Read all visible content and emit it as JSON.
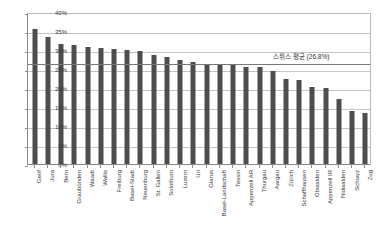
{
  "chart_data": {
    "type": "bar",
    "title": "",
    "xlabel": "",
    "ylabel": "",
    "ylim": [
      0,
      40
    ],
    "ytick_labels": [
      "0%",
      "5%",
      "10%",
      "15%",
      "20%",
      "25%",
      "30%",
      "35%",
      "40%"
    ],
    "ytick_values": [
      0,
      5,
      10,
      15,
      20,
      25,
      30,
      35,
      40
    ],
    "grid": true,
    "legend": "none",
    "bar_color": "#4d4d4d",
    "categories": [
      "Genf",
      "Jura",
      "Bern",
      "Graubünden",
      "Waadt",
      "Wallis",
      "Freiburg",
      "Basel-Stadt",
      "Neuenburg",
      "St. Gallen",
      "Solothurn",
      "Luzern",
      "Uri",
      "Glarus",
      "Basel-Landschaft",
      "Tessin",
      "Appenzell AR",
      "Thurgau",
      "Aargau",
      "Zürich",
      "Schaffhausen",
      "Obwalden",
      "Appenzell IR",
      "Nidwalden",
      "Schwyz",
      "Zug"
    ],
    "values": [
      35.5,
      33.3,
      31.6,
      31.3,
      30.9,
      30.4,
      30.2,
      30.1,
      29.8,
      28.6,
      28.2,
      27.4,
      26.9,
      26.2,
      26.2,
      26.0,
      25.5,
      25.5,
      24.5,
      22.5,
      22.1,
      20.2,
      20.1,
      17.0,
      13.9,
      13.5
    ],
    "annotations": [
      {
        "name": "swiss-average",
        "text": "스위스 평균 (26.8%)",
        "value": 26.8,
        "line_color": "#7a7a7a"
      }
    ]
  }
}
